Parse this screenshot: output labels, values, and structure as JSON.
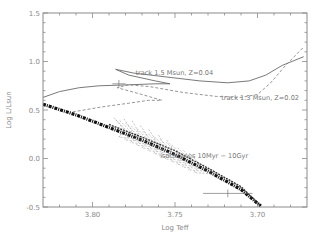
{
  "chart_data": {
    "type": "line",
    "title": "",
    "xlabel": "Log Teff",
    "ylabel": "Log L/Lsun",
    "xlim": [
      3.83,
      3.67
    ],
    "ylim": [
      -0.5,
      1.5
    ],
    "x_reversed": true,
    "grid": false,
    "x_ticks": [
      3.8,
      3.75,
      3.7
    ],
    "x_tick_labels": [
      "3.80",
      "3.75",
      "3.70"
    ],
    "y_ticks": [
      -0.5,
      0.0,
      0.5,
      1.0,
      1.5
    ],
    "y_tick_labels": [
      "-0.5",
      "0.0",
      "0.5",
      "1.0",
      "1.5"
    ],
    "series": [
      {
        "name": "track 1.5 Msun, Z=0.04",
        "style": "solid",
        "x": [
          3.83,
          3.82,
          3.808,
          3.796,
          3.778,
          3.762,
          3.753,
          3.762,
          3.778,
          3.786,
          3.775,
          3.755,
          3.735,
          3.718,
          3.705,
          3.695,
          3.685,
          3.672
        ],
        "y": [
          0.63,
          0.69,
          0.73,
          0.75,
          0.76,
          0.77,
          0.77,
          0.8,
          0.86,
          0.92,
          0.88,
          0.84,
          0.8,
          0.78,
          0.8,
          0.86,
          0.96,
          1.05
        ]
      },
      {
        "name": "track 1.3 Msun, Z=0.02",
        "style": "dashed",
        "x": [
          3.812,
          3.795,
          3.778,
          3.766,
          3.758,
          3.77,
          3.785,
          3.778,
          3.765,
          3.745,
          3.725,
          3.71,
          3.7,
          3.692,
          3.683,
          3.672
        ],
        "y": [
          0.48,
          0.53,
          0.57,
          0.6,
          0.6,
          0.66,
          0.73,
          0.76,
          0.74,
          0.68,
          0.64,
          0.63,
          0.66,
          0.78,
          0.96,
          1.15
        ]
      },
      {
        "name": "isochrone main sequence (thick)",
        "style": "dash-dot-thick",
        "x": [
          3.83,
          3.81,
          3.79,
          3.77,
          3.75,
          3.73,
          3.71,
          3.698
        ],
        "y": [
          0.56,
          0.45,
          0.32,
          0.19,
          0.04,
          -0.13,
          -0.32,
          -0.49
        ]
      },
      {
        "name": "isochrone upper band",
        "style": "dashed-band",
        "x": [
          3.79,
          3.77,
          3.75,
          3.73,
          3.71,
          3.698
        ],
        "y": [
          0.35,
          0.22,
          0.08,
          -0.1,
          -0.29,
          -0.49
        ]
      }
    ],
    "isochrone_hooks": [
      {
        "x": [
          3.786,
          3.781,
          3.784
        ],
        "y": [
          0.4,
          0.3,
          0.22
        ]
      },
      {
        "x": [
          3.781,
          3.776,
          3.779
        ],
        "y": [
          0.41,
          0.29,
          0.2
        ]
      },
      {
        "x": [
          3.776,
          3.772,
          3.774
        ],
        "y": [
          0.39,
          0.27,
          0.18
        ]
      },
      {
        "x": [
          3.771,
          3.767,
          3.769
        ],
        "y": [
          0.34,
          0.24,
          0.15
        ]
      },
      {
        "x": [
          3.766,
          3.762,
          3.764
        ],
        "y": [
          0.3,
          0.2,
          0.12
        ]
      },
      {
        "x": [
          3.76,
          3.757,
          3.758
        ],
        "y": [
          0.24,
          0.16,
          0.08
        ]
      },
      {
        "x": [
          3.755,
          3.752,
          3.753
        ],
        "y": [
          0.19,
          0.12,
          0.04
        ]
      }
    ],
    "error_crosses": [
      {
        "x": 3.784,
        "y": 0.77,
        "dx": 0.004,
        "dy": 0.04
      },
      {
        "x": 3.718,
        "y": -0.36,
        "dx": 0.015,
        "dy": 0.04
      }
    ],
    "annotations": [
      {
        "text": "track 1.5 Msun, Z=0.04",
        "x": 3.774,
        "y": 0.86
      },
      {
        "text": "track 1.3 Msun, Z=0.02",
        "x": 3.722,
        "y": 0.6
      },
      {
        "text": "isochrones 10Myr − 10Gyr",
        "x": 3.759,
        "y": 0.01
      }
    ]
  }
}
